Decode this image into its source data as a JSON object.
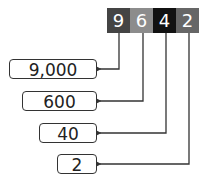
{
  "number": {
    "digits": [
      {
        "value": "9",
        "color": "#444444"
      },
      {
        "value": "6",
        "color": "#8c8c8c"
      },
      {
        "value": "4",
        "color": "#111111"
      },
      {
        "value": "2",
        "color": "#666666"
      }
    ]
  },
  "place_values": [
    "9,000",
    "600",
    "40",
    "2"
  ]
}
